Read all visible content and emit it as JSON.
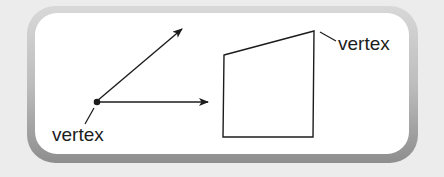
{
  "figure": {
    "angle": {
      "vertex_label": "vertex",
      "vertex_point": [
        97,
        101
      ],
      "ray_up_end": [
        182,
        28
      ],
      "ray_right_end": [
        208,
        102
      ]
    },
    "quadrilateral": {
      "vertex_label": "vertex",
      "points": [
        [
          224,
          55
        ],
        [
          314,
          31
        ],
        [
          313,
          137
        ],
        [
          223,
          137
        ]
      ]
    },
    "colors": {
      "background": "#ececec",
      "frame_fill": "#ffffff",
      "frame_border": "#a8a8a8",
      "line": "#1c1c1c"
    }
  }
}
